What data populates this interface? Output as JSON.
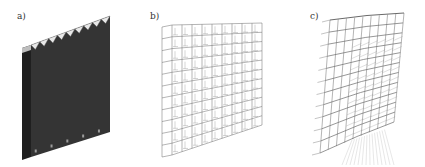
{
  "figure": {
    "panels": [
      {
        "id": "a",
        "label": "a)",
        "description": "Solid building model (rendered mass)",
        "floors": 11,
        "bays": 9,
        "fill_color": "#2e2e2e"
      },
      {
        "id": "b",
        "label": "b)",
        "description": "Wireframe structural model, undeformed",
        "floors": 11,
        "bays": 9,
        "line_color": "#6a6a6a"
      },
      {
        "id": "c",
        "label": "c)",
        "description": "Wireframe structural model, deformed",
        "floors": 11,
        "bays": 9,
        "line_color": "#6a6a6a"
      }
    ]
  }
}
